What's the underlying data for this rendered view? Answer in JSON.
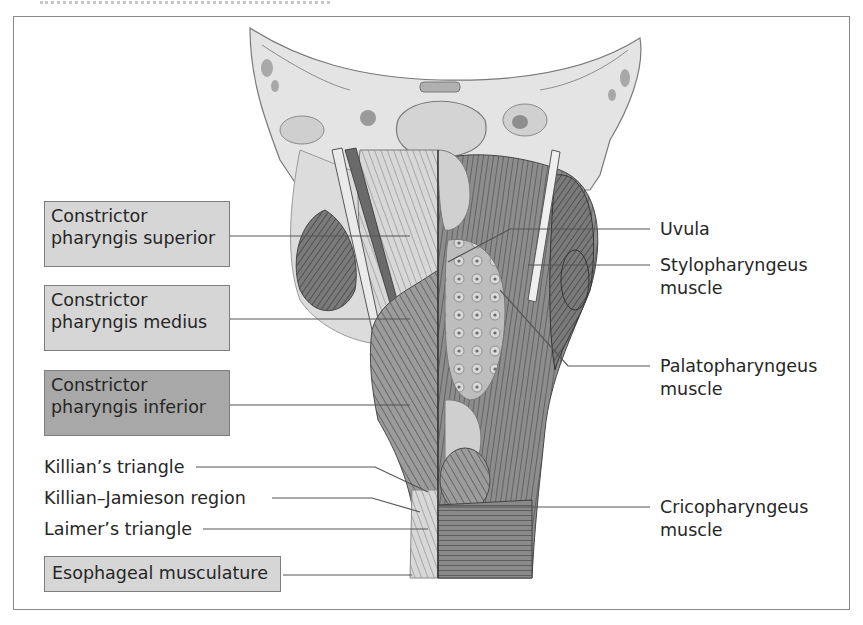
{
  "figure": {
    "frame_border_color": "#8a8a8a",
    "box_fill_light": "#d6d6d6",
    "box_fill_dark": "#a8a8a8",
    "leader_line_color": "#555555"
  },
  "left_labels": {
    "constrictor_superior": {
      "line1": "Constrictor",
      "line2": "pharyngis superior"
    },
    "constrictor_medius": {
      "line1": "Constrictor",
      "line2": "pharyngis medius"
    },
    "constrictor_inferior": {
      "line1": "Constrictor",
      "line2": "pharyngis inferior"
    },
    "killians_triangle": "Killian’s triangle",
    "killian_jamieson": "Killian–Jamieson region",
    "laimers_triangle": "Laimer’s triangle",
    "esophageal": "Esophageal musculature"
  },
  "right_labels": {
    "uvula": "Uvula",
    "stylopharyngeus": {
      "line1": "Stylopharyngeus",
      "line2": "muscle"
    },
    "palatopharyngeus": {
      "line1": "Palatopharyngeus",
      "line2": "muscle"
    },
    "cricopharyngeus": {
      "line1": "Cricopharyngeus",
      "line2": "muscle"
    }
  }
}
